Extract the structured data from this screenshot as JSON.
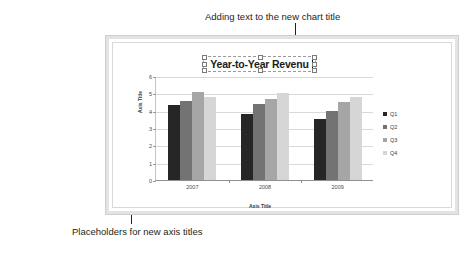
{
  "annotations": {
    "top": "Adding text to the new chart title",
    "bottom": "Placeholders for new axis titles"
  },
  "slide": {
    "chart_title_text": "Year-to-Year Revenu",
    "yaxis_title_placeholder": "Axis Title",
    "xaxis_title_placeholder": "Axis Title"
  },
  "chart_data": {
    "type": "bar",
    "title": "Year-to-Year Revenu",
    "xlabel": "Axis Title",
    "ylabel": "Axis Title",
    "categories": [
      "2007",
      "2008",
      "2009"
    ],
    "ylim": [
      0,
      6
    ],
    "yticks": [
      "0",
      "1",
      "2",
      "3",
      "4",
      "5",
      "6"
    ],
    "grid": true,
    "legend_position": "right",
    "series": [
      {
        "name": "Q1",
        "color": "#262626",
        "values": [
          4.3,
          3.8,
          3.5
        ]
      },
      {
        "name": "Q2",
        "color": "#737373",
        "values": [
          4.55,
          4.4,
          4.0
        ]
      },
      {
        "name": "Q3",
        "color": "#a6a6a6",
        "values": [
          5.1,
          4.65,
          4.5
        ]
      },
      {
        "name": "Q4",
        "color": "#d6d6d6",
        "values": [
          4.8,
          5.0,
          4.8
        ]
      }
    ]
  }
}
